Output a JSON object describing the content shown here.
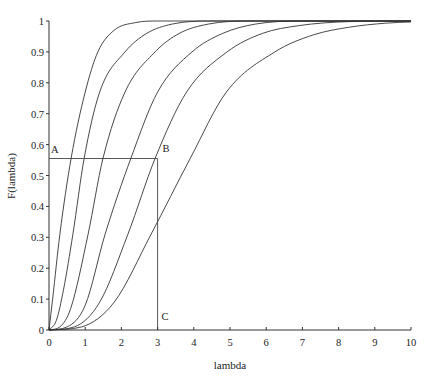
{
  "chart_data": {
    "type": "line",
    "title": "",
    "xlabel": "lambda",
    "ylabel": "F(lambda)",
    "xlim": [
      0,
      10
    ],
    "ylim": [
      0,
      1
    ],
    "x_ticks": [
      "0",
      "1",
      "2",
      "3",
      "4",
      "5",
      "6",
      "7",
      "8",
      "9",
      "10"
    ],
    "y_ticks": [
      "0",
      "0.1",
      "0.2",
      "0.3",
      "0.4",
      "0.5",
      "0.6",
      "0.7",
      "0.8",
      "0.9",
      "1"
    ],
    "grid": false,
    "legend": null,
    "series": [
      {
        "name": "curve-1",
        "x": [
          0,
          0.1,
          0.3,
          0.61,
          1.0,
          1.35,
          1.8,
          2.4,
          3.0,
          4.0,
          10
        ],
        "y": [
          0,
          0.1,
          0.31,
          0.555,
          0.77,
          0.9,
          0.97,
          0.995,
          1,
          1,
          1
        ]
      },
      {
        "name": "curve-2",
        "x": [
          0,
          0.2,
          0.4,
          0.66,
          0.97,
          1.4,
          2.1,
          2.7,
          3.4,
          4.5,
          10
        ],
        "y": [
          0,
          0.03,
          0.13,
          0.31,
          0.555,
          0.77,
          0.9,
          0.96,
          0.99,
          1,
          1
        ]
      },
      {
        "name": "curve-3",
        "x": [
          0,
          0.3,
          0.6,
          1.08,
          1.49,
          2.1,
          2.93,
          3.6,
          4.4,
          5.5,
          10
        ],
        "y": [
          0,
          0.01,
          0.07,
          0.31,
          0.555,
          0.77,
          0.9,
          0.96,
          0.99,
          1,
          1
        ]
      },
      {
        "name": "curve-4",
        "x": [
          0,
          0.5,
          1.0,
          1.55,
          2.26,
          3.0,
          3.95,
          4.8,
          5.7,
          7.0,
          10
        ],
        "y": [
          0,
          0.01,
          0.08,
          0.31,
          0.555,
          0.77,
          0.9,
          0.96,
          0.99,
          1,
          1
        ]
      },
      {
        "name": "curve-5",
        "x": [
          0,
          0.7,
          1.4,
          2.18,
          2.93,
          3.8,
          4.92,
          5.9,
          6.9,
          8.3,
          10
        ],
        "y": [
          0,
          0.01,
          0.09,
          0.31,
          0.555,
          0.77,
          0.9,
          0.96,
          0.985,
          0.998,
          1
        ]
      },
      {
        "name": "curve-6",
        "x": [
          0,
          0.9,
          1.8,
          2.82,
          3.9,
          4.9,
          6.24,
          7.3,
          8.3,
          9.3,
          10
        ],
        "y": [
          0,
          0.01,
          0.09,
          0.31,
          0.555,
          0.77,
          0.9,
          0.955,
          0.98,
          0.993,
          0.997
        ]
      }
    ],
    "annotations": [
      {
        "label": "A",
        "x": 0,
        "y": 0.555
      },
      {
        "label": "B",
        "x": 3,
        "y": 0.555
      },
      {
        "label": "C",
        "x": 3,
        "y": 0
      }
    ],
    "guide_lines": [
      {
        "from": [
          0,
          0.555
        ],
        "to": [
          3,
          0.555
        ]
      },
      {
        "from": [
          3,
          0.555
        ],
        "to": [
          3,
          0
        ]
      }
    ]
  }
}
